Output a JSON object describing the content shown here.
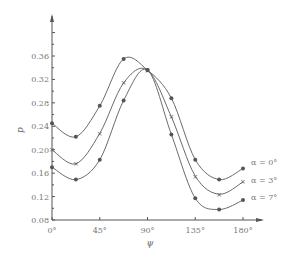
{
  "chart_data": {
    "type": "line",
    "title": "",
    "xlabel": "ψ",
    "ylabel": "p",
    "xlim": [
      0,
      180
    ],
    "ylim": [
      0.08,
      0.4
    ],
    "grid": false,
    "legend_position": "right, inline at curve ends",
    "x_ticks": [
      0,
      45,
      90,
      135,
      180
    ],
    "x_tick_labels": [
      "0°",
      "45°",
      "90°",
      "135°",
      "180°"
    ],
    "y_ticks": [
      0.08,
      0.12,
      0.16,
      0.2,
      0.24,
      0.28,
      0.32,
      0.36
    ],
    "y_tick_labels": [
      "0.08",
      "0.12",
      "0.16",
      "0.20",
      "0.24",
      "0.28",
      "0.32",
      "0.36"
    ],
    "x": [
      0,
      22.5,
      45,
      67.5,
      90,
      112.5,
      135,
      157.5,
      180
    ],
    "series": [
      {
        "name": "α = 0°",
        "marker": "dot",
        "values": [
          0.245,
          0.222,
          0.275,
          0.355,
          0.336,
          0.288,
          0.183,
          0.149,
          0.168
        ]
      },
      {
        "name": "α = 3°",
        "marker": "cross",
        "values": [
          0.2,
          0.176,
          0.228,
          0.314,
          0.336,
          0.256,
          0.155,
          0.124,
          0.145
        ]
      },
      {
        "name": "α = 7°",
        "marker": "dot",
        "values": [
          0.17,
          0.149,
          0.183,
          0.284,
          0.336,
          0.226,
          0.117,
          0.098,
          0.114
        ]
      }
    ]
  }
}
